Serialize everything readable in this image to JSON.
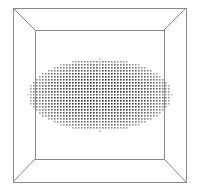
{
  "scene": {
    "type": "3d-point-cloud-in-box",
    "box": {
      "outer": {
        "x1": 13,
        "y1": 8,
        "x2": 186,
        "y2": 182
      },
      "inner": {
        "x1": 35,
        "y1": 30,
        "x2": 164,
        "y2": 159
      },
      "stroke": "#8a8a8a"
    },
    "ellipsoid": {
      "cx": 99,
      "cy": 94,
      "rx": 72,
      "ry": 36,
      "dot_spacing": 3,
      "dot_size": 1.6,
      "color_dark": "#2a2a2a",
      "color_light": "#bdbdbd"
    }
  }
}
